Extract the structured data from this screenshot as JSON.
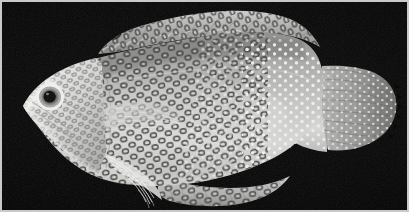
{
  "figure": {
    "kind": "specimen-photograph",
    "medium": "black-and-white photograph",
    "orientation": "head to the left, tail to the right",
    "background_color": "#000000",
    "frame_color": "#c9c9c9",
    "caption": "",
    "scale_bar": "",
    "label": ""
  },
  "specimen": {
    "body": {
      "name": "fish-body",
      "tone": "pale gray",
      "highlight_color": "#e8e8e6",
      "midtone_color": "#b4b4b2",
      "shadow_color": "#6e6e6c",
      "outline_color": "#2a2a2a"
    },
    "head": {
      "name": "head",
      "snout": "pointed, directed left",
      "snout_tone": "bright pale"
    },
    "eye": {
      "name": "eye",
      "pupil_color": "#101010",
      "iris_ring_color": "#8a8a88",
      "sclera_ring_color": "#f2f2f0",
      "shape": "round with pale concentric ring"
    },
    "markings": {
      "anterior_pattern": "dark rings / ocelli with pale centers on head and fore-body",
      "posterior_pattern": "small bright white spots on caudal peduncle and tail",
      "ring_color": "#3a3a38",
      "ring_center_color": "#d8d8d6",
      "spot_color": "#f0f0ee"
    },
    "fins": [
      {
        "name": "dorsal-fin",
        "label": "dorsal fin",
        "edge": "scalloped, spinous anteriorly",
        "tone": "pale gray"
      },
      {
        "name": "caudal-fin",
        "label": "caudal fin",
        "edge": "rounded to truncate, rayed",
        "tone": "mid gray"
      },
      {
        "name": "anal-fin",
        "label": "anal fin",
        "edge": "long, rounded posteriorly",
        "tone": "pale gray"
      },
      {
        "name": "pectoral-fin",
        "label": "pectoral fin",
        "edge": "translucent fan of rays",
        "tone": "translucent pale"
      },
      {
        "name": "pelvic-fin",
        "label": "pelvic fin",
        "edge": "narrow, trailing rays",
        "tone": "bright pale"
      }
    ],
    "dorsal_notch": {
      "name": "dorsal-notch-shadow",
      "description": "dark shadowed gap near front of dorsal fin"
    }
  }
}
